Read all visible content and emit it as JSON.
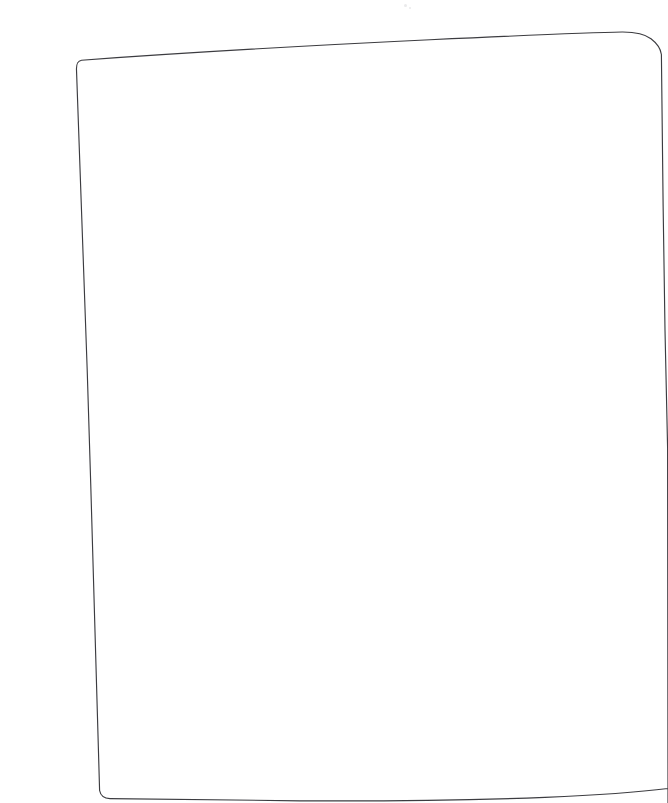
{
  "document": {
    "kind": "scanned-blank-page",
    "description": "Photographed or scanned blank sheet of paper with a thin dark border outline, slightly warped by perspective",
    "canvas": {
      "width": 668,
      "height": 803
    },
    "content_text": "",
    "has_visible_text": false,
    "has_visible_graphics": false
  },
  "colors": {
    "canvas_background": "#ffffff",
    "page_fill": "#ffffff",
    "outline_stroke": "#3c3c40",
    "speck": "#d8d8da"
  },
  "outline": {
    "stroke_width": 1.15,
    "corners": {
      "top_left": [
        76,
        69
      ],
      "top_right": [
        660,
        50
      ],
      "bottom_right": [
        668,
        787
      ],
      "bottom_left": [
        100,
        798
      ]
    },
    "path": "M 76.5 70 C 76.2 63.5 77.5 61.0 81.5 60.2 C 160 54.5 300 46.0 430 39.8 C 520 35.6 585 32.6 622 32.0 C 636 31.9 645 34.0 651 38.8 C 657 43.4 660.6 48.6 661.4 54.5 C 662.2 120 663.4 250 665.0 330 C 666.0 372 667.0 410 667.6 448 L 668 803 L 668 788.5 C 640 792.0 600 795.0 545 797.4 C 470 800.2 380 801.2 300 800.8 C 215 800.4 150 799.6 110 798.6 C 104 798.4 100.6 796.0 99.6 790.5 C 97.0 700 92.0 520 87.2 370 C 83.4 250 79.6 140 76.5 70 Z",
    "notes": "Right edge and bottom-right corner extend beyond the canvas; shape is clipped at x=668."
  },
  "specks": [
    {
      "x": 404,
      "y": 4,
      "size": 3
    },
    {
      "x": 409,
      "y": 7,
      "size": 2
    }
  ]
}
